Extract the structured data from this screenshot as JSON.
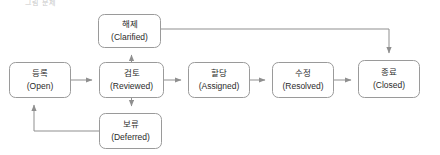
{
  "diagram": {
    "title_fragment": "그림 문제",
    "type": "state-transition-flowchart",
    "stroke_color": "#8f8f8f",
    "node_fill": "#ffffff",
    "text_color": "#2b2b2b",
    "nodes": [
      {
        "id": "clarified",
        "ko": "해제",
        "en": "(Clarified)",
        "x": 98,
        "y": 14,
        "w": 63,
        "h": 34
      },
      {
        "id": "open",
        "ko": "등록",
        "en": "(Open)",
        "x": 9,
        "y": 62,
        "w": 62,
        "h": 36
      },
      {
        "id": "reviewed",
        "ko": "검토",
        "en": "(Reviewed)",
        "x": 99,
        "y": 62,
        "w": 65,
        "h": 36
      },
      {
        "id": "assigned",
        "ko": "할당",
        "en": "(Assigned)",
        "x": 188,
        "y": 62,
        "w": 62,
        "h": 36
      },
      {
        "id": "resolved",
        "ko": "수정",
        "en": "(Resolved)",
        "x": 272,
        "y": 62,
        "w": 62,
        "h": 36
      },
      {
        "id": "closed",
        "ko": "종료",
        "en": "(Closed)",
        "x": 358,
        "y": 60,
        "w": 62,
        "h": 38
      },
      {
        "id": "deferred",
        "ko": "보류",
        "en": "(Deferred)",
        "x": 99,
        "y": 113,
        "w": 63,
        "h": 36
      }
    ],
    "edges": [
      {
        "id": "open-to-reviewed",
        "from": "open",
        "to": "reviewed"
      },
      {
        "id": "reviewed-to-assigned",
        "from": "reviewed",
        "to": "assigned"
      },
      {
        "id": "assigned-to-resolved",
        "from": "assigned",
        "to": "resolved"
      },
      {
        "id": "resolved-to-closed",
        "from": "resolved",
        "to": "closed"
      },
      {
        "id": "reviewed-to-clarified",
        "from": "reviewed",
        "to": "clarified"
      },
      {
        "id": "clarified-to-closed",
        "from": "clarified",
        "to": "closed"
      },
      {
        "id": "reviewed-to-deferred",
        "from": "reviewed",
        "to": "deferred"
      },
      {
        "id": "deferred-to-open",
        "from": "deferred",
        "to": "open"
      }
    ]
  }
}
